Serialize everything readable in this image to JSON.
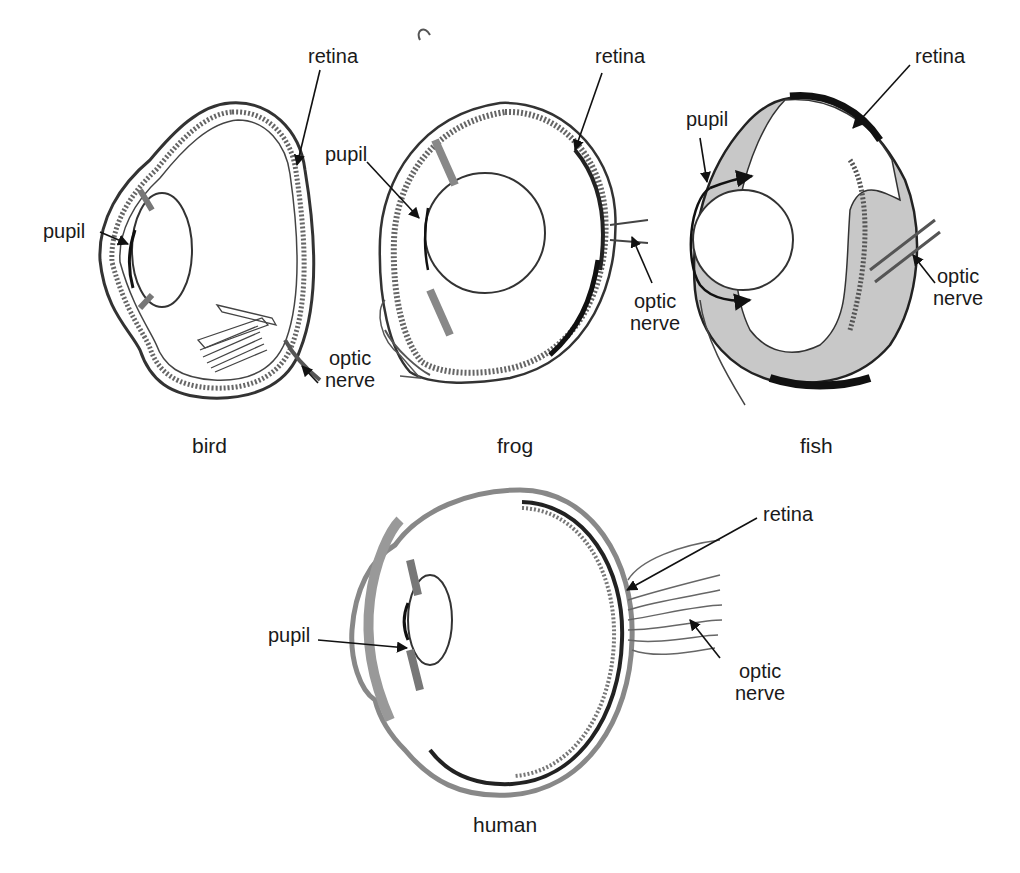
{
  "figure": {
    "diagrams": [
      {
        "id": "bird",
        "caption": "bird",
        "labels": {
          "retina": "retina",
          "pupil": "pupil",
          "optic_nerve_1": "optic",
          "optic_nerve_2": "nerve"
        }
      },
      {
        "id": "frog",
        "caption": "frog",
        "labels": {
          "retina": "retina",
          "pupil": "pupil",
          "optic_nerve_1": "optic",
          "optic_nerve_2": "nerve"
        }
      },
      {
        "id": "fish",
        "caption": "fish",
        "labels": {
          "retina": "retina",
          "pupil": "pupil",
          "optic_nerve_1": "optic",
          "optic_nerve_2": "nerve"
        }
      },
      {
        "id": "human",
        "caption": "human",
        "labels": {
          "retina": "retina",
          "pupil": "pupil",
          "optic_nerve_1": "optic",
          "optic_nerve_2": "nerve"
        }
      }
    ]
  }
}
